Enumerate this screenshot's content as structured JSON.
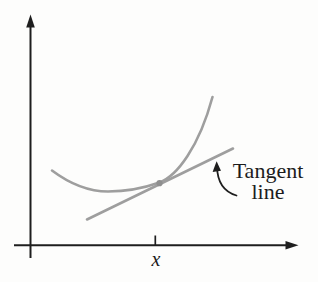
{
  "figure": {
    "labels": {
      "tangent_line1": "Tangent",
      "tangent_line2": "line",
      "x_axis_point": "x"
    },
    "colors": {
      "axis": "#1e1e1e",
      "curve": "#9e9e9e",
      "tangent_line": "#9e9e9e",
      "tangency_dot": "#8f8f8f",
      "annotation_arrow": "#1e1e1e",
      "text": "#1c1c1c",
      "background": "#fdfdfc"
    },
    "paths": {
      "curve_d": "M 52 170.5 C 70 184, 88 191.5, 108 191.5 C 127 191.5, 144 188, 159.5 182.5 C 177 176, 199 147, 212.5 97",
      "annotation_arrow_d": "M 236.5 195.5 Q 217.5 190, 217 166.5"
    },
    "geometry": {
      "tangency_point_px": [
        159.5,
        183.2
      ],
      "tangent_segment_px": [
        [
          87,
          219.5
        ],
        [
          233,
          148.5
        ]
      ],
      "x_tick_px": 155.3,
      "axes_origin_px": [
        30.5,
        245.3
      ]
    }
  }
}
